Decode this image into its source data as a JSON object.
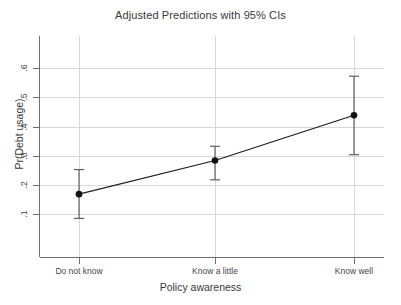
{
  "chart_data": {
    "type": "line",
    "title": "Adjusted Predictions with 95% CIs",
    "xlabel": "Policy awareness",
    "ylabel": "Pr(Debt usage)",
    "categories": [
      "Do not know",
      "Know a little",
      "Know well"
    ],
    "values": [
      0.168,
      0.283,
      0.438
    ],
    "ci_lower": [
      0.085,
      0.217,
      0.303
    ],
    "ci_upper": [
      0.252,
      0.332,
      0.572
    ],
    "ci_level": "95%",
    "ylim": [
      0.04,
      0.665
    ],
    "yticks": [
      0.1,
      0.2,
      0.3,
      0.4,
      0.5,
      0.6
    ],
    "ytick_labels": [
      ".1",
      ".2",
      ".3",
      ".4",
      ".5",
      ".6"
    ],
    "xlim": [
      0,
      2
    ],
    "grid": "horizontal and vertical",
    "legend": "none",
    "marker": "filled circle",
    "series": [
      {
        "name": "Pr(Debt usage)",
        "values": [
          0.168,
          0.283,
          0.438
        ],
        "ci_lower": [
          0.085,
          0.217,
          0.303
        ],
        "ci_upper": [
          0.252,
          0.332,
          0.572
        ]
      }
    ],
    "colors": {
      "line": "#1a1a1a",
      "marker": "#111111",
      "error_bar": "#555555",
      "grid": "#d8d8d8",
      "axis": "#6f6f6f",
      "text": "#39393b",
      "background": "#ffffff"
    }
  },
  "axes": {
    "y_ticks": [
      {
        "label": ".6",
        "value": 0.6
      },
      {
        "label": ".5",
        "value": 0.5
      },
      {
        "label": ".4",
        "value": 0.4
      },
      {
        "label": ".3",
        "value": 0.3
      },
      {
        "label": ".2",
        "value": 0.2
      },
      {
        "label": ".1",
        "value": 0.1
      }
    ],
    "x_ticks": [
      {
        "label": "Do not know",
        "value": 0
      },
      {
        "label": "Know a little",
        "value": 1
      },
      {
        "label": "Know well",
        "value": 2
      }
    ]
  }
}
